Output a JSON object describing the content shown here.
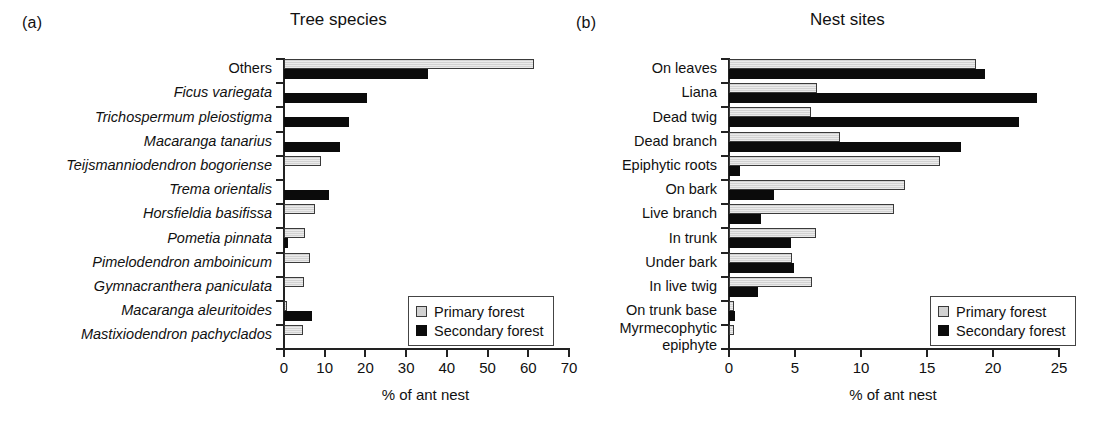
{
  "figure": {
    "axis_title": "% of ant nest",
    "legend": {
      "primary_label": "Primary forest",
      "secondary_label": "Secondary forest",
      "primary_color": "#d2d2d2",
      "secondary_color": "#0b0b0b"
    }
  },
  "panel_a": {
    "letter": "(a)",
    "title": "Tree species"
  },
  "panel_b": {
    "letter": "(b)",
    "title": "Nest sites"
  },
  "chart_data": [
    {
      "type": "bar",
      "orientation": "horizontal",
      "panel": "(a)",
      "title": "Tree species",
      "xlabel": "% of ant nest",
      "ylabel": "",
      "xlim": [
        0,
        70
      ],
      "xticks": [
        0,
        10,
        20,
        30,
        40,
        50,
        60,
        70
      ],
      "xticklabels": [
        "0",
        "10",
        "20",
        "30",
        "40",
        "50",
        "60",
        "70"
      ],
      "grid": false,
      "legend_position": "lower right",
      "label_style": "italic-species-names",
      "categories": [
        "Others",
        "Ficus variegata",
        "Trichospermum pleiostigma",
        "Macaranga tanarius",
        "Teijsmanniodendron bogoriense",
        "Trema orientalis",
        "Horsfieldia basifissa",
        "Pometia pinnata",
        "Pimelodendron amboinicum",
        "Gymnacranthera paniculata",
        "Macaranga aleuritoides",
        "Mastixiodendron pachyclados"
      ],
      "categories_italic": [
        false,
        true,
        true,
        true,
        true,
        true,
        true,
        true,
        true,
        true,
        true,
        true
      ],
      "series": [
        {
          "name": "Primary forest",
          "color": "#d2d2d2",
          "values": [
            61.4,
            0,
            0,
            0,
            9.1,
            0,
            7.6,
            5.2,
            6.4,
            5.0,
            0.6,
            4.6
          ]
        },
        {
          "name": "Secondary forest",
          "color": "#0b0b0b",
          "values": [
            35.4,
            20.4,
            16.0,
            13.8,
            0,
            11.1,
            0,
            1.0,
            0,
            0,
            6.9,
            0
          ]
        }
      ]
    },
    {
      "type": "bar",
      "orientation": "horizontal",
      "panel": "(b)",
      "title": "Nest sites",
      "xlabel": "% of ant nest",
      "ylabel": "",
      "xlim": [
        0,
        25
      ],
      "xticks": [
        0,
        5,
        10,
        15,
        20,
        25
      ],
      "xticklabels": [
        "0",
        "5",
        "10",
        "15",
        "20",
        "25"
      ],
      "grid": false,
      "legend_position": "lower right",
      "categories": [
        "On leaves",
        "Liana",
        "Dead twig",
        "Dead branch",
        "Epiphytic roots",
        "On bark",
        "Live branch",
        "In trunk",
        "Under bark",
        "In live twig",
        "On trunk base",
        "Myrmecophytic epiphyte"
      ],
      "series": [
        {
          "name": "Primary forest",
          "color": "#d2d2d2",
          "values": [
            18.7,
            6.7,
            6.2,
            8.4,
            16.0,
            13.3,
            12.5,
            6.6,
            4.8,
            6.3,
            0.35,
            0.4
          ]
        },
        {
          "name": "Secondary forest",
          "color": "#0b0b0b",
          "values": [
            19.4,
            23.3,
            22.0,
            17.6,
            0.8,
            3.4,
            2.4,
            4.7,
            4.9,
            2.2,
            0.45,
            0
          ]
        }
      ]
    }
  ]
}
